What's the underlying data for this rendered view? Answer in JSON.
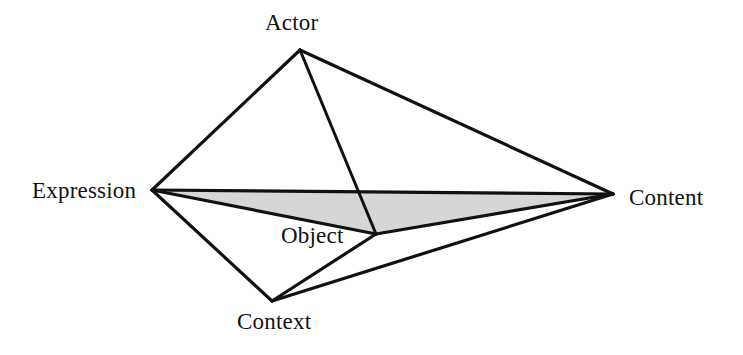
{
  "figure": {
    "type": "node-link-diagram",
    "shape": "tetrahedral-wireframe",
    "background_color": "#ffffff",
    "line_color": "#111111",
    "shaded_face_color": "#d6d6d6",
    "labels": {
      "actor": "Actor",
      "expression": "Expression",
      "content": "Content",
      "object": "Object",
      "context": "Context"
    },
    "nodes": [
      {
        "id": "actor",
        "label": "Actor",
        "x": 300,
        "y": 50
      },
      {
        "id": "expression",
        "label": "Expression",
        "x": 152,
        "y": 190
      },
      {
        "id": "content",
        "label": "Content",
        "x": 613,
        "y": 194
      },
      {
        "id": "object",
        "label": "Object",
        "x": 376,
        "y": 234
      },
      {
        "id": "context",
        "label": "Context",
        "x": 272,
        "y": 301
      }
    ],
    "edges": [
      {
        "from": "actor",
        "to": "expression"
      },
      {
        "from": "actor",
        "to": "content"
      },
      {
        "from": "actor",
        "to": "object"
      },
      {
        "from": "expression",
        "to": "content"
      },
      {
        "from": "expression",
        "to": "object"
      },
      {
        "from": "expression",
        "to": "context"
      },
      {
        "from": "content",
        "to": "object"
      },
      {
        "from": "content",
        "to": "context"
      },
      {
        "from": "object",
        "to": "context"
      }
    ],
    "shaded_faces": [
      {
        "vertices": [
          "expression",
          "content",
          "object"
        ],
        "fill": "#d6d6d6"
      }
    ]
  }
}
